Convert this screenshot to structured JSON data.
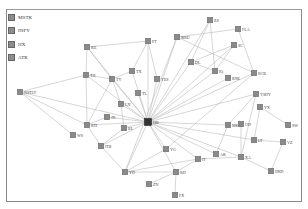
{
  "legend": {
    "items": [
      {
        "label": "MSTK"
      },
      {
        "label": "INFY"
      },
      {
        "label": "HX"
      },
      {
        "label": "ATK"
      }
    ]
  },
  "graph": {
    "colors": {
      "node": "#8a8a8a",
      "hub": "#333333",
      "edge": "#b4b4b4",
      "border": "#8a8a8a"
    },
    "hub": {
      "id": "HUB",
      "label": "HB",
      "x": 148,
      "y": 122
    },
    "nodes": [
      {
        "id": "KE",
        "label": "KE",
        "x": 87,
        "y": 47
      },
      {
        "id": "PT",
        "label": "PT",
        "x": 148,
        "y": 41
      },
      {
        "id": "TX",
        "label": "TX",
        "x": 132,
        "y": 71
      },
      {
        "id": "YES",
        "label": "YES",
        "x": 157,
        "y": 79
      },
      {
        "id": "TL",
        "label": "TL",
        "x": 138,
        "y": 93
      },
      {
        "id": "TH",
        "label": "TH",
        "x": 86,
        "y": 75
      },
      {
        "id": "TY",
        "label": "TY",
        "x": 112,
        "y": 79
      },
      {
        "id": "NSTLY",
        "label": "NSTLY",
        "x": 20,
        "y": 92
      },
      {
        "id": "LN",
        "label": "LN",
        "x": 121,
        "y": 104
      },
      {
        "id": "JN",
        "label": "JN",
        "x": 107,
        "y": 117
      },
      {
        "id": "RTI",
        "label": "RTI",
        "x": 87,
        "y": 125
      },
      {
        "id": "RL",
        "label": "RL",
        "x": 124,
        "y": 128
      },
      {
        "id": "WS",
        "label": "WS",
        "x": 73,
        "y": 135
      },
      {
        "id": "ITB",
        "label": "ITB",
        "x": 101,
        "y": 146
      },
      {
        "id": "YD",
        "label": "YD",
        "x": 125,
        "y": 172
      },
      {
        "id": "YG",
        "label": "YG",
        "x": 166,
        "y": 149
      },
      {
        "id": "IT",
        "label": "IT",
        "x": 198,
        "y": 159
      },
      {
        "id": "BH",
        "label": "BH",
        "x": 176,
        "y": 172
      },
      {
        "id": "ZN",
        "label": "ZN",
        "x": 149,
        "y": 184
      },
      {
        "id": "FX",
        "label": "FX",
        "x": 175,
        "y": 195
      },
      {
        "id": "RS",
        "label": "RS",
        "x": 210,
        "y": 20
      },
      {
        "id": "FLA",
        "label": "FLA",
        "x": 238,
        "y": 29
      },
      {
        "id": "MSU",
        "label": "MSU",
        "x": 177,
        "y": 37
      },
      {
        "id": "SC",
        "label": "SC",
        "x": 234,
        "y": 45
      },
      {
        "id": "DL",
        "label": "DL",
        "x": 191,
        "y": 62
      },
      {
        "id": "IQ",
        "label": "IQ",
        "x": 215,
        "y": 71
      },
      {
        "id": "RCB",
        "label": "RCB",
        "x": 254,
        "y": 73
      },
      {
        "id": "RNE",
        "label": "RNE",
        "x": 228,
        "y": 78
      },
      {
        "id": "YSDY",
        "label": "YSDY",
        "x": 256,
        "y": 94
      },
      {
        "id": "YX",
        "label": "YX",
        "x": 260,
        "y": 107
      },
      {
        "id": "SW",
        "label": "SW",
        "x": 288,
        "y": 125
      },
      {
        "id": "MKT",
        "label": "MKE",
        "x": 228,
        "y": 125
      },
      {
        "id": "OD",
        "label": "OD",
        "x": 241,
        "y": 124
      },
      {
        "id": "LT",
        "label": "LT",
        "x": 254,
        "y": 140
      },
      {
        "id": "VZ",
        "label": "VZ",
        "x": 283,
        "y": 142
      },
      {
        "id": "AK",
        "label": "AK",
        "x": 216,
        "y": 154
      },
      {
        "id": "XA",
        "label": "XA",
        "x": 241,
        "y": 157
      },
      {
        "id": "DRD",
        "label": "DRD",
        "x": 271,
        "y": 171
      }
    ],
    "edges": [
      [
        "HUB",
        "KE"
      ],
      [
        "HUB",
        "PT"
      ],
      [
        "HUB",
        "TX"
      ],
      [
        "HUB",
        "YES"
      ],
      [
        "HUB",
        "TL"
      ],
      [
        "HUB",
        "TH"
      ],
      [
        "HUB",
        "TY"
      ],
      [
        "HUB",
        "NSTLY"
      ],
      [
        "HUB",
        "LN"
      ],
      [
        "HUB",
        "JN"
      ],
      [
        "HUB",
        "RTI"
      ],
      [
        "HUB",
        "RL"
      ],
      [
        "HUB",
        "ITB"
      ],
      [
        "HUB",
        "YD"
      ],
      [
        "HUB",
        "YG"
      ],
      [
        "HUB",
        "IT"
      ],
      [
        "HUB",
        "BH"
      ],
      [
        "HUB",
        "MSU"
      ],
      [
        "HUB",
        "DL"
      ],
      [
        "HUB",
        "IQ"
      ],
      [
        "HUB",
        "SC"
      ],
      [
        "HUB",
        "RNE"
      ],
      [
        "HUB",
        "RCB"
      ],
      [
        "HUB",
        "YSDY"
      ],
      [
        "HUB",
        "MKT"
      ],
      [
        "HUB",
        "LT"
      ],
      [
        "HUB",
        "XA"
      ],
      [
        "HUB",
        "AK"
      ],
      [
        "HUB",
        "RS"
      ],
      [
        "KE",
        "PT"
      ],
      [
        "KE",
        "TH"
      ],
      [
        "KE",
        "TY"
      ],
      [
        "PT",
        "TX"
      ],
      [
        "PT",
        "YES"
      ],
      [
        "TX",
        "TY"
      ],
      [
        "TH",
        "TY"
      ],
      [
        "TH",
        "RTI"
      ],
      [
        "TH",
        "NSTLY"
      ],
      [
        "TY",
        "LN"
      ],
      [
        "TY",
        "RTI"
      ],
      [
        "NSTLY",
        "RTI"
      ],
      [
        "NSTLY",
        "WS"
      ],
      [
        "RTI",
        "JN"
      ],
      [
        "RTI",
        "ITB"
      ],
      [
        "RL",
        "ITB"
      ],
      [
        "LN",
        "RL"
      ],
      [
        "YD",
        "YG"
      ],
      [
        "YD",
        "ITB"
      ],
      [
        "YD",
        "BH"
      ],
      [
        "YD",
        "IT"
      ],
      [
        "BH",
        "IT"
      ],
      [
        "BH",
        "ZN"
      ],
      [
        "BH",
        "FX"
      ],
      [
        "RS",
        "DL"
      ],
      [
        "RS",
        "IQ"
      ],
      [
        "MSU",
        "FLA"
      ],
      [
        "MSU",
        "RCB"
      ],
      [
        "MSU",
        "YD"
      ],
      [
        "FLA",
        "RCB"
      ],
      [
        "SC",
        "DL"
      ],
      [
        "SC",
        "IQ"
      ],
      [
        "DL",
        "IQ"
      ],
      [
        "RCB",
        "YG"
      ],
      [
        "YSDY",
        "MKT"
      ],
      [
        "YSDY",
        "XA"
      ],
      [
        "YX",
        "SW"
      ],
      [
        "YX",
        "LT"
      ],
      [
        "MKT",
        "AK"
      ],
      [
        "OD",
        "XA"
      ],
      [
        "LT",
        "VZ"
      ],
      [
        "XA",
        "DRD"
      ],
      [
        "DRD",
        "VZ"
      ],
      [
        "XA",
        "IT"
      ]
    ]
  }
}
